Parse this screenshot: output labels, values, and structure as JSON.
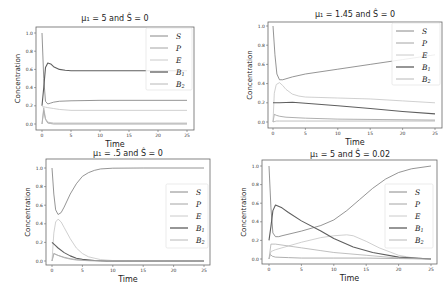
{
  "figure": {
    "width": 448,
    "height": 294
  },
  "colors": {
    "S": "#7a7a7a",
    "P": "#9a9a9a",
    "E": "#c4c4c4",
    "B1": "#5e5e5e",
    "B2": "#b0b0b0"
  },
  "chart_data": [
    {
      "type": "line",
      "title": "μ₁ = 5 and Ŝ = 0",
      "xlabel": "Time",
      "ylabel": "Concentration",
      "xlim": [
        0,
        25
      ],
      "ylim": [
        0,
        1.0
      ],
      "xticks": [
        "0",
        "5",
        "10",
        "15",
        "20",
        "25"
      ],
      "yticks": [
        "0.0",
        "0.2",
        "0.4",
        "0.6",
        "0.8",
        "1.0"
      ],
      "grid": false,
      "legend": [
        "S",
        "P",
        "E",
        "B1",
        "B2"
      ],
      "legend_position": "upper right",
      "series": [
        {
          "name": "S",
          "x": [
            0,
            0.3,
            0.6,
            1.0,
            1.5,
            2,
            3,
            5,
            10,
            25
          ],
          "values": [
            1.0,
            0.5,
            0.25,
            0.22,
            0.23,
            0.24,
            0.25,
            0.255,
            0.26,
            0.26
          ]
        },
        {
          "name": "P",
          "x": [
            0,
            0.3,
            0.6,
            1.0,
            1.5,
            2,
            25
          ],
          "values": [
            0.0,
            0.15,
            0.05,
            0.01,
            0.005,
            0.0,
            0.0
          ]
        },
        {
          "name": "E",
          "x": [
            0,
            0.3,
            0.6,
            1,
            2,
            3,
            5,
            10,
            25
          ],
          "values": [
            0.19,
            0.19,
            0.185,
            0.18,
            0.17,
            0.16,
            0.15,
            0.15,
            0.15
          ]
        },
        {
          "name": "B1",
          "x": [
            0,
            0.3,
            0.6,
            1.0,
            1.5,
            2,
            3,
            4,
            5,
            10,
            25
          ],
          "values": [
            0.2,
            0.4,
            0.62,
            0.67,
            0.66,
            0.63,
            0.6,
            0.59,
            0.585,
            0.585,
            0.585
          ]
        },
        {
          "name": "B2",
          "x": [
            0,
            0.3,
            0.6,
            1,
            2,
            25
          ],
          "values": [
            0.0,
            0.18,
            0.06,
            0.02,
            0.01,
            0.01
          ]
        }
      ]
    },
    {
      "type": "line",
      "title": "μ₁ = 1.45 and Ŝ = 0",
      "xlabel": "Time",
      "ylabel": "Concentration",
      "xlim": [
        0,
        25
      ],
      "ylim": [
        0,
        1.0
      ],
      "xticks": [
        "0",
        "5",
        "10",
        "15",
        "20",
        "25"
      ],
      "yticks": [
        "0.0",
        "0.2",
        "0.4",
        "0.6",
        "0.8",
        "1.0"
      ],
      "grid": false,
      "legend": [
        "S",
        "P",
        "E",
        "B1",
        "B2"
      ],
      "legend_position": "upper right",
      "series": [
        {
          "name": "S",
          "x": [
            0,
            0.3,
            0.6,
            1.0,
            1.5,
            2,
            3,
            5,
            10,
            15,
            20,
            25
          ],
          "values": [
            1.0,
            0.7,
            0.5,
            0.44,
            0.44,
            0.45,
            0.47,
            0.5,
            0.55,
            0.6,
            0.65,
            0.7
          ]
        },
        {
          "name": "P",
          "x": [
            0,
            0.2,
            0.5,
            1,
            2,
            5,
            10,
            25
          ],
          "values": [
            0.0,
            0.08,
            0.07,
            0.06,
            0.05,
            0.04,
            0.03,
            0.02
          ]
        },
        {
          "name": "E",
          "x": [
            0,
            0.2,
            0.5,
            1.0,
            1.5,
            2,
            3,
            4,
            5,
            10,
            15,
            20,
            25
          ],
          "values": [
            0.0,
            0.3,
            0.39,
            0.41,
            0.38,
            0.34,
            0.29,
            0.27,
            0.26,
            0.25,
            0.24,
            0.22,
            0.2
          ]
        },
        {
          "name": "B1",
          "x": [
            0,
            1,
            3,
            5,
            10,
            15,
            20,
            25
          ],
          "values": [
            0.2,
            0.2,
            0.205,
            0.195,
            0.17,
            0.14,
            0.11,
            0.085
          ]
        },
        {
          "name": "B2",
          "x": [
            0,
            0.5,
            1,
            5,
            10,
            15,
            20,
            25
          ],
          "values": [
            0.0,
            0.01,
            0.01,
            0.01,
            0.01,
            0.01,
            0.01,
            0.01
          ]
        }
      ]
    },
    {
      "type": "line",
      "title": "μ₁ = .5 and Ŝ = 0",
      "xlabel": "Time",
      "ylabel": "Concentration",
      "xlim": [
        0,
        25
      ],
      "ylim": [
        0,
        1.0
      ],
      "xticks": [
        "0",
        "5",
        "10",
        "15",
        "20",
        "25"
      ],
      "yticks": [
        "0.0",
        "0.2",
        "0.4",
        "0.6",
        "0.8",
        "1.0"
      ],
      "grid": false,
      "legend": [
        "S",
        "P",
        "E",
        "B1",
        "B2"
      ],
      "legend_position": "center right",
      "series": [
        {
          "name": "S",
          "x": [
            0,
            0.3,
            0.6,
            1.0,
            1.5,
            2,
            3,
            4,
            5,
            6,
            7,
            8,
            10,
            15,
            25
          ],
          "values": [
            1.0,
            0.72,
            0.55,
            0.5,
            0.52,
            0.58,
            0.72,
            0.83,
            0.91,
            0.95,
            0.975,
            0.99,
            0.998,
            1.0,
            1.0
          ]
        },
        {
          "name": "P",
          "x": [
            0,
            0.3,
            1,
            2,
            3,
            4,
            6,
            8,
            25
          ],
          "values": [
            0.0,
            0.08,
            0.06,
            0.04,
            0.025,
            0.015,
            0.005,
            0.0,
            0.0
          ]
        },
        {
          "name": "E",
          "x": [
            0,
            0.3,
            0.6,
            1.0,
            1.5,
            2,
            3,
            4,
            5,
            6,
            8,
            10,
            25
          ],
          "values": [
            0.0,
            0.3,
            0.42,
            0.45,
            0.42,
            0.36,
            0.24,
            0.14,
            0.08,
            0.045,
            0.015,
            0.005,
            0.0
          ]
        },
        {
          "name": "B1",
          "x": [
            0,
            0.5,
            1,
            2,
            3,
            4,
            5,
            7,
            9,
            25
          ],
          "values": [
            0.2,
            0.17,
            0.14,
            0.09,
            0.055,
            0.03,
            0.018,
            0.005,
            0.0,
            0.0
          ]
        },
        {
          "name": "B2",
          "x": [
            0,
            0.3,
            1,
            2,
            3,
            4,
            6,
            25
          ],
          "values": [
            0.0,
            0.08,
            0.06,
            0.035,
            0.02,
            0.01,
            0.003,
            0.0
          ]
        }
      ]
    },
    {
      "type": "line",
      "title": "μ₁ = 5 and Ŝ = 0.02",
      "xlabel": "Time",
      "ylabel": "Concentration",
      "xlim": [
        0,
        25
      ],
      "ylim": [
        0,
        1.0
      ],
      "xticks": [
        "0",
        "5",
        "10",
        "15",
        "20",
        "25"
      ],
      "yticks": [
        "0.0",
        "0.2",
        "0.4",
        "0.6",
        "0.8",
        "1.0"
      ],
      "grid": false,
      "legend": [
        "S",
        "P",
        "E",
        "B1",
        "B2"
      ],
      "legend_position": "center right",
      "series": [
        {
          "name": "S",
          "x": [
            0,
            0.3,
            0.6,
            1.0,
            1.5,
            2,
            5,
            8,
            10,
            12,
            14,
            16,
            18,
            20,
            22,
            25
          ],
          "values": [
            1.0,
            0.55,
            0.28,
            0.24,
            0.24,
            0.25,
            0.3,
            0.36,
            0.42,
            0.52,
            0.64,
            0.76,
            0.86,
            0.93,
            0.97,
            1.0
          ]
        },
        {
          "name": "P",
          "x": [
            0,
            0.2,
            0.5,
            1,
            3,
            5,
            10,
            15,
            20,
            25
          ],
          "values": [
            0.0,
            0.05,
            0.03,
            0.02,
            0.015,
            0.01,
            0.01,
            0.01,
            0.005,
            0.0
          ]
        },
        {
          "name": "E",
          "x": [
            0,
            0.3,
            1,
            3,
            5,
            8,
            10,
            12,
            13,
            15,
            17,
            20,
            22,
            25
          ],
          "values": [
            0.0,
            0.08,
            0.1,
            0.14,
            0.18,
            0.23,
            0.25,
            0.26,
            0.25,
            0.19,
            0.12,
            0.04,
            0.015,
            0.0
          ]
        },
        {
          "name": "B1",
          "x": [
            0,
            0.3,
            0.6,
            1.0,
            2,
            3,
            5,
            8,
            10,
            13,
            16,
            20,
            25
          ],
          "values": [
            0.2,
            0.35,
            0.52,
            0.58,
            0.55,
            0.5,
            0.41,
            0.3,
            0.22,
            0.13,
            0.07,
            0.02,
            0.0
          ]
        },
        {
          "name": "B2",
          "x": [
            0,
            0.3,
            1,
            3,
            5,
            8,
            10,
            15,
            20,
            25
          ],
          "values": [
            0.0,
            0.16,
            0.16,
            0.14,
            0.12,
            0.09,
            0.07,
            0.04,
            0.01,
            0.0
          ]
        }
      ]
    }
  ],
  "panels": [
    {
      "title": "μ₁ = 5 and Ŝ = 0",
      "xlabel": "Time",
      "ylabel": "Concentration",
      "xticks": [
        "0",
        "5",
        "10",
        "15",
        "20",
        "25"
      ],
      "yticks": [
        "0.0",
        "0.2",
        "0.4",
        "0.6",
        "0.8",
        "1.0"
      ],
      "legend": [
        {
          "key": "S",
          "label": "S",
          "sub": ""
        },
        {
          "key": "P",
          "label": "P",
          "sub": ""
        },
        {
          "key": "E",
          "label": "E",
          "sub": ""
        },
        {
          "key": "B1",
          "label": "B",
          "sub": "1"
        },
        {
          "key": "B2",
          "label": "B",
          "sub": "2"
        }
      ]
    },
    {
      "title": "μ₁ = 1.45 and Ŝ = 0",
      "xlabel": "Time",
      "ylabel": "Concentration",
      "xticks": [
        "0",
        "5",
        "10",
        "15",
        "20",
        "25"
      ],
      "yticks": [
        "0.0",
        "0.2",
        "0.4",
        "0.6",
        "0.8",
        "1.0"
      ],
      "legend": [
        {
          "key": "S",
          "label": "S",
          "sub": ""
        },
        {
          "key": "P",
          "label": "P",
          "sub": ""
        },
        {
          "key": "E",
          "label": "E",
          "sub": ""
        },
        {
          "key": "B1",
          "label": "B",
          "sub": "1"
        },
        {
          "key": "B2",
          "label": "B",
          "sub": "2"
        }
      ]
    },
    {
      "title": "μ₁ = .5 and Ŝ = 0",
      "xlabel": "Time",
      "ylabel": "Concentration",
      "xticks": [
        "0",
        "5",
        "10",
        "15",
        "20",
        "25"
      ],
      "yticks": [
        "0.0",
        "0.2",
        "0.4",
        "0.6",
        "0.8",
        "1.0"
      ],
      "legend": [
        {
          "key": "S",
          "label": "S",
          "sub": ""
        },
        {
          "key": "P",
          "label": "P",
          "sub": ""
        },
        {
          "key": "E",
          "label": "E",
          "sub": ""
        },
        {
          "key": "B1",
          "label": "B",
          "sub": "1"
        },
        {
          "key": "B2",
          "label": "B",
          "sub": "2"
        }
      ]
    },
    {
      "title": "μ₁ = 5 and Ŝ = 0.02",
      "xlabel": "Time",
      "ylabel": "Concentration",
      "xticks": [
        "0",
        "5",
        "10",
        "15",
        "20",
        "25"
      ],
      "yticks": [
        "0.0",
        "0.2",
        "0.4",
        "0.6",
        "0.8",
        "1.0"
      ],
      "legend": [
        {
          "key": "S",
          "label": "S",
          "sub": ""
        },
        {
          "key": "P",
          "label": "P",
          "sub": ""
        },
        {
          "key": "E",
          "label": "E",
          "sub": ""
        },
        {
          "key": "B1",
          "label": "B",
          "sub": "1"
        },
        {
          "key": "B2",
          "label": "B",
          "sub": "2"
        }
      ]
    }
  ]
}
